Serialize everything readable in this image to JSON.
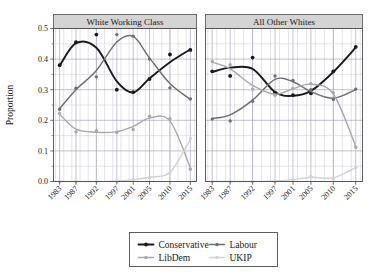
{
  "chart_data": {
    "type": "line",
    "title": "",
    "xlabel": "",
    "ylabel": "Proportion",
    "ylim": [
      0.0,
      0.5
    ],
    "yticks": [
      "0.0",
      "0.1",
      "0.2",
      "0.3",
      "0.4",
      "0.5"
    ],
    "ytick_values": [
      0.0,
      0.1,
      0.2,
      0.3,
      0.4,
      0.5
    ],
    "grid": true,
    "legend_position": "bottom",
    "x": [
      1983,
      1987,
      1992,
      1997,
      2001,
      2005,
      2010,
      2015
    ],
    "categories": [
      "1983",
      "1987",
      "1992",
      "1997",
      "2001",
      "2005",
      "2010",
      "2015"
    ],
    "panels": [
      {
        "label": "White Working Class",
        "series": [
          {
            "name": "Conservative",
            "color": "#1a1a1a",
            "values": [
              0.38,
              0.455,
              0.48,
              0.3,
              0.292,
              0.335,
              0.415,
              0.43
            ],
            "smooth": [
              0.378,
              0.452,
              0.437,
              0.327,
              0.291,
              0.337,
              0.39,
              0.432
            ]
          },
          {
            "name": "Labour",
            "color": "#6e6e6e",
            "values": [
              0.236,
              0.305,
              0.342,
              0.48,
              0.475,
              0.4,
              0.306,
              0.27
            ],
            "smooth": [
              0.238,
              0.3,
              0.363,
              0.456,
              0.474,
              0.404,
              0.32,
              0.268
            ]
          },
          {
            "name": "LibDem",
            "color": "#a8a8a8",
            "values": [
              0.222,
              0.162,
              0.166,
              0.16,
              0.17,
              0.213,
              0.205,
              0.04
            ],
            "smooth": [
              0.22,
              0.171,
              0.161,
              0.163,
              0.18,
              0.207,
              0.198,
              0.045
            ]
          },
          {
            "name": "UKIP",
            "color": "#d2d2d2",
            "values": [
              0.0,
              0.0,
              0.0,
              0.0,
              0.005,
              0.012,
              0.028,
              0.14
            ],
            "smooth": [
              0.0,
              0.0,
              0.0,
              0.002,
              0.006,
              0.014,
              0.03,
              0.138
            ]
          }
        ]
      },
      {
        "label": "All Other Whites",
        "series": [
          {
            "name": "Conservative",
            "color": "#1a1a1a",
            "values": [
              0.36,
              0.345,
              0.405,
              0.29,
              0.282,
              0.288,
              0.36,
              0.44
            ],
            "smooth": [
              0.358,
              0.372,
              0.368,
              0.292,
              0.28,
              0.296,
              0.358,
              0.438
            ]
          },
          {
            "name": "Labour",
            "color": "#6e6e6e",
            "values": [
              0.204,
              0.198,
              0.262,
              0.345,
              0.33,
              0.3,
              0.268,
              0.302
            ],
            "smooth": [
              0.206,
              0.218,
              0.266,
              0.334,
              0.326,
              0.294,
              0.272,
              0.3
            ]
          },
          {
            "name": "LibDem",
            "color": "#a8a8a8",
            "values": [
              0.392,
              0.382,
              0.302,
              0.282,
              0.305,
              0.32,
              0.29,
              0.112
            ],
            "smooth": [
              0.39,
              0.368,
              0.314,
              0.285,
              0.303,
              0.318,
              0.286,
              0.115
            ]
          },
          {
            "name": "UKIP",
            "color": "#d2d2d2",
            "values": [
              0.0,
              0.0,
              0.0,
              0.0,
              0.004,
              0.016,
              0.01,
              0.046
            ],
            "smooth": [
              0.0,
              0.0,
              0.0,
              0.002,
              0.006,
              0.014,
              0.012,
              0.045
            ]
          }
        ]
      }
    ],
    "legend": [
      {
        "name": "Conservative",
        "color": "#1a1a1a"
      },
      {
        "name": "Labour",
        "color": "#6e6e6e"
      },
      {
        "name": "LibDem",
        "color": "#a8a8a8"
      },
      {
        "name": "UKIP",
        "color": "#d2d2d2"
      }
    ]
  },
  "axis": {
    "ylabel": "Proportion"
  }
}
